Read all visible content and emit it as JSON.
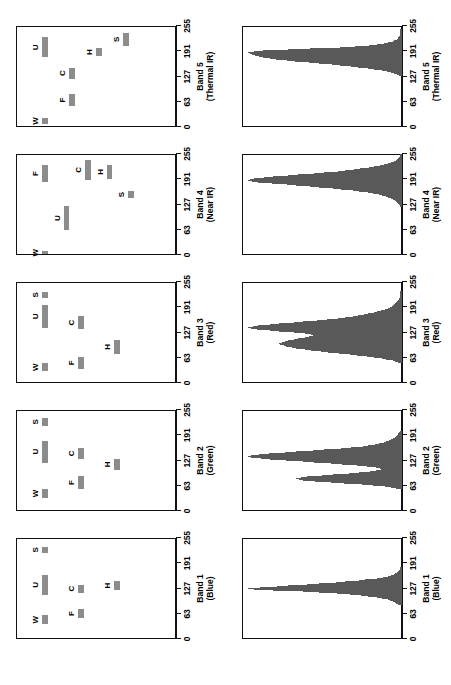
{
  "figure": {
    "panel_a_caption": "(a)",
    "panel_b_caption": "(b)"
  },
  "axis": {
    "ticks": [
      0,
      63,
      127,
      191,
      255
    ],
    "tick_labels": [
      "0",
      "63",
      "127",
      "191",
      "255"
    ],
    "min": 0,
    "max": 255
  },
  "bands": [
    {
      "name": "Band 1",
      "descriptor": "(Blue)"
    },
    {
      "name": "Band 2",
      "descriptor": "(Green)"
    },
    {
      "name": "Band 3",
      "descriptor": "(Red)"
    },
    {
      "name": "Band 4",
      "descriptor": "(Near IR)"
    },
    {
      "name": "Band 5",
      "descriptor": "(Thermal IR)"
    }
  ],
  "class_tags": [
    "W",
    "F",
    "U",
    "C",
    "H",
    "S"
  ],
  "colors": {
    "bar_fill": "#8c8c8c",
    "hist_fill": "#595959",
    "axis": "#111111",
    "background": "#ffffff"
  },
  "chart_data": [
    {
      "type": "bar",
      "subtype": "range-bars",
      "title": "(b) Spectral signature brightness value ranges by band",
      "xlabel": "",
      "ylabel": "",
      "xlim": [
        0,
        255
      ],
      "grid": false,
      "legend": "inline-labels",
      "categories": [
        "Band 1 (Blue)",
        "Band 2 (Green)",
        "Band 3 (Red)",
        "Band 4 (Near IR)",
        "Band 5 (Thermal IR)"
      ],
      "panels": [
        {
          "band": "Band 1",
          "descriptor": "(Blue)",
          "ranges": [
            {
              "tag": "W",
              "start": 38,
              "end": 60,
              "row": 0
            },
            {
              "tag": "F",
              "start": 52,
              "end": 77,
              "row": 1
            },
            {
              "tag": "U",
              "start": 112,
              "end": 162,
              "row": 0
            },
            {
              "tag": "C",
              "start": 117,
              "end": 137,
              "row": 1
            },
            {
              "tag": "H",
              "start": 123,
              "end": 147,
              "row": 2
            },
            {
              "tag": "S",
              "start": 218,
              "end": 232,
              "row": 0
            }
          ]
        },
        {
          "band": "Band 2",
          "descriptor": "(Green)",
          "ranges": [
            {
              "tag": "W",
              "start": 33,
              "end": 56,
              "row": 0
            },
            {
              "tag": "F",
              "start": 56,
              "end": 88,
              "row": 1
            },
            {
              "tag": "U",
              "start": 122,
              "end": 178,
              "row": 0
            },
            {
              "tag": "C",
              "start": 131,
              "end": 160,
              "row": 1
            },
            {
              "tag": "H",
              "start": 103,
              "end": 132,
              "row": 2
            },
            {
              "tag": "S",
              "start": 215,
              "end": 235,
              "row": 0
            }
          ]
        },
        {
          "band": "Band 3",
          "descriptor": "(Red)",
          "ranges": [
            {
              "tag": "W",
              "start": 30,
              "end": 50,
              "row": 0
            },
            {
              "tag": "F",
              "start": 36,
              "end": 66,
              "row": 1
            },
            {
              "tag": "U",
              "start": 140,
              "end": 196,
              "row": 0
            },
            {
              "tag": "C",
              "start": 137,
              "end": 168,
              "row": 1
            },
            {
              "tag": "H",
              "start": 74,
              "end": 108,
              "row": 2
            },
            {
              "tag": "S",
              "start": 214,
              "end": 231,
              "row": 0
            }
          ]
        },
        {
          "band": "Band 4",
          "descriptor": "(Near IR)",
          "ranges": [
            {
              "tag": "W",
              "start": 2,
              "end": 10,
              "row": 0
            },
            {
              "tag": "F",
              "start": 185,
              "end": 226,
              "row": 0
            },
            {
              "tag": "U",
              "start": 62,
              "end": 124,
              "row": 1
            },
            {
              "tag": "C",
              "start": 190,
              "end": 240,
              "row": 2
            },
            {
              "tag": "H",
              "start": 192,
              "end": 228,
              "row": 3
            },
            {
              "tag": "S",
              "start": 143,
              "end": 162,
              "row": 4
            }
          ]
        },
        {
          "band": "Band 5",
          "descriptor": "(Thermal IR)",
          "ranges": [
            {
              "tag": "W",
              "start": 8,
              "end": 22,
              "row": 0
            },
            {
              "tag": "F",
              "start": 52,
              "end": 84,
              "row": 1
            },
            {
              "tag": "U",
              "start": 176,
              "end": 226,
              "row": 0
            },
            {
              "tag": "C",
              "start": 122,
              "end": 150,
              "row": 1
            },
            {
              "tag": "H",
              "start": 178,
              "end": 200,
              "row": 2
            },
            {
              "tag": "S",
              "start": 205,
              "end": 238,
              "row": 3
            }
          ]
        }
      ]
    },
    {
      "type": "bar",
      "subtype": "histogram",
      "title": "(a) Brightness value histograms by band",
      "xlabel": "",
      "ylabel": "",
      "xlim": [
        0,
        255
      ],
      "grid": false,
      "bin_width": 1,
      "panels": [
        {
          "band": "Band 1",
          "descriptor": "(Blue)",
          "x": [
            85,
            90,
            95,
            100,
            104,
            108,
            112,
            115,
            118,
            120,
            122,
            124,
            126,
            128,
            130,
            132,
            134,
            136,
            138,
            140,
            142,
            144,
            146,
            148,
            150,
            152,
            155,
            158,
            162,
            166,
            170,
            175,
            180
          ],
          "values": [
            2,
            4,
            6,
            10,
            16,
            24,
            34,
            46,
            58,
            70,
            84,
            96,
            100,
            92,
            84,
            78,
            70,
            62,
            54,
            46,
            40,
            34,
            28,
            24,
            18,
            14,
            10,
            7,
            5,
            3,
            2,
            1,
            1
          ]
        },
        {
          "band": "Band 2",
          "descriptor": "(Green)",
          "x": [
            55,
            60,
            64,
            68,
            72,
            76,
            80,
            84,
            88,
            92,
            96,
            100,
            104,
            108,
            112,
            116,
            120,
            124,
            128,
            132,
            136,
            140,
            144,
            148,
            152,
            156,
            160,
            165,
            170,
            176,
            182,
            190,
            200
          ],
          "values": [
            3,
            8,
            18,
            32,
            48,
            60,
            66,
            62,
            50,
            36,
            24,
            16,
            12,
            14,
            22,
            34,
            48,
            62,
            76,
            88,
            96,
            92,
            80,
            66,
            52,
            38,
            26,
            18,
            12,
            8,
            5,
            3,
            1
          ]
        },
        {
          "band": "Band 3",
          "descriptor": "(Red)",
          "x": [
            50,
            56,
            62,
            68,
            74,
            80,
            86,
            92,
            98,
            104,
            110,
            114,
            118,
            122,
            126,
            130,
            134,
            138,
            142,
            146,
            150,
            154,
            158,
            162,
            168,
            174,
            180,
            186,
            192,
            200,
            210,
            220,
            230
          ],
          "values": [
            2,
            6,
            14,
            26,
            40,
            54,
            66,
            74,
            78,
            74,
            66,
            60,
            56,
            58,
            66,
            78,
            90,
            98,
            94,
            84,
            72,
            60,
            48,
            38,
            28,
            20,
            14,
            9,
            6,
            4,
            2,
            1,
            1
          ]
        },
        {
          "band": "Band 4",
          "descriptor": "(Near IR)",
          "x": [
            120,
            128,
            135,
            142,
            148,
            154,
            158,
            162,
            166,
            170,
            174,
            178,
            181,
            184,
            187,
            190,
            193,
            196,
            199,
            202,
            205,
            208,
            212,
            216,
            220,
            224,
            228,
            232,
            236,
            240,
            244,
            248,
            252
          ],
          "values": [
            1,
            2,
            4,
            7,
            11,
            17,
            24,
            32,
            42,
            54,
            66,
            78,
            88,
            96,
            100,
            98,
            92,
            84,
            74,
            64,
            54,
            44,
            35,
            27,
            20,
            14,
            10,
            7,
            4,
            3,
            2,
            1,
            1
          ]
        },
        {
          "band": "Band 5",
          "descriptor": "(Thermal IR)",
          "x": [
            128,
            132,
            136,
            140,
            144,
            148,
            152,
            156,
            160,
            163,
            166,
            169,
            172,
            175,
            178,
            181,
            184,
            186,
            188,
            190,
            192,
            194,
            196,
            198,
            200,
            203,
            206,
            210,
            214,
            220,
            226,
            234,
            244
          ],
          "values": [
            1,
            3,
            6,
            10,
            16,
            24,
            33,
            43,
            54,
            64,
            72,
            80,
            86,
            90,
            94,
            96,
            98,
            100,
            98,
            94,
            86,
            74,
            60,
            46,
            34,
            24,
            16,
            10,
            6,
            3,
            2,
            1,
            1
          ]
        }
      ]
    }
  ]
}
